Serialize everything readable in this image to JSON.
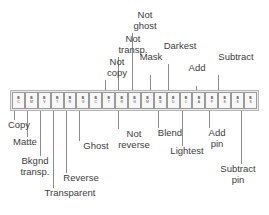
{
  "figure": {
    "kind": "labelled-toolbar-diagram",
    "colors": {
      "toolbar_fill": "#ececec",
      "toolbar_border": "#b4b4b4",
      "button_fill": "#f7f7f7",
      "button_border": "#9a9a9a",
      "leader_line": "#8c8c8c",
      "label_text": "#3d3d3d",
      "page_background": "#ffffff"
    }
  },
  "toolbar": {
    "name": "transfer-mode-toolbar",
    "button_count": 19,
    "buttons": [
      {
        "index": 0,
        "glyph_top": "B",
        "glyph_bottom": "C",
        "mode": "Copy"
      },
      {
        "index": 1,
        "glyph_top": "B",
        "glyph_bottom": "M",
        "mode": "Matte"
      },
      {
        "index": 2,
        "glyph_top": "B",
        "glyph_bottom": "V",
        "mode": "Bkgnd transp."
      },
      {
        "index": 3,
        "glyph_top": "B",
        "glyph_bottom": "T",
        "mode": "Transparent"
      },
      {
        "index": 4,
        "glyph_top": "B",
        "glyph_bottom": "R",
        "mode": "Reverse"
      },
      {
        "index": 5,
        "glyph_top": "B",
        "glyph_bottom": "G",
        "mode": "Ghost"
      },
      {
        "index": 6,
        "glyph_top": "B",
        "glyph_bottom": "C",
        "mode": "Not copy"
      },
      {
        "index": 7,
        "glyph_top": "B",
        "glyph_bottom": "T",
        "mode": "Not transp."
      },
      {
        "index": 8,
        "glyph_top": "B",
        "glyph_bottom": "R",
        "mode": "Not reverse"
      },
      {
        "index": 9,
        "glyph_top": "B",
        "glyph_bottom": "G",
        "mode": "Not ghost"
      },
      {
        "index": 10,
        "glyph_top": "B",
        "glyph_bottom": "M",
        "mode": "Mask"
      },
      {
        "index": 11,
        "glyph_top": "B",
        "glyph_bottom": "B",
        "mode": "Blend"
      },
      {
        "index": 12,
        "glyph_top": "B",
        "glyph_bottom": "D",
        "mode": "Darkest"
      },
      {
        "index": 13,
        "glyph_top": "B",
        "glyph_bottom": "L",
        "mode": "Lightest"
      },
      {
        "index": 14,
        "glyph_top": "B",
        "glyph_bottom": "A",
        "mode": "Add"
      },
      {
        "index": 15,
        "glyph_top": "B",
        "glyph_bottom": "P",
        "mode": "Add pin"
      },
      {
        "index": 16,
        "glyph_top": "B",
        "glyph_bottom": "S",
        "mode": "Subtract"
      },
      {
        "index": 17,
        "glyph_top": "B",
        "glyph_bottom": "S",
        "mode": "Subtract pin"
      },
      {
        "index": 18,
        "glyph_top": "B",
        "glyph_bottom": "S",
        "mode": "Subtract pin"
      }
    ]
  },
  "labels_above": [
    {
      "id": "not-copy",
      "text": "Not\ncopy",
      "left": 100,
      "top": 56,
      "width": 34,
      "target_x": 105
    },
    {
      "id": "not-transp",
      "text": "Not\ntransp.",
      "left": 113,
      "top": 33,
      "width": 40,
      "target_x": 118
    },
    {
      "id": "not-ghost",
      "text": "Not\nghost",
      "left": 127,
      "top": 9,
      "width": 36,
      "target_x": 132
    },
    {
      "id": "mask",
      "text": "Mask",
      "left": 146,
      "top": 51,
      "width": 30,
      "target_x": 150
    },
    {
      "id": "darkest",
      "text": "Darkest",
      "left": 163,
      "top": 40,
      "width": 44,
      "target_x": 168
    },
    {
      "id": "add",
      "text": "Add",
      "left": 192,
      "top": 62,
      "width": 26,
      "target_x": 196
    },
    {
      "id": "subtract",
      "text": "Subtract",
      "left": 213,
      "top": 51,
      "width": 50,
      "target_x": 218
    }
  ],
  "labels_below": [
    {
      "id": "copy",
      "text": "Copy",
      "left": 9,
      "top": 119,
      "width": 32,
      "target_x": 14
    },
    {
      "id": "matte",
      "text": "Matte",
      "left": 16,
      "top": 136,
      "width": 34,
      "target_x": 27
    },
    {
      "id": "bkgnd-transp",
      "text": "Bkgnd\ntransp.",
      "left": 26,
      "top": 155,
      "width": 42,
      "target_x": 40
    },
    {
      "id": "transparent",
      "text": "Transparent",
      "left": 41,
      "top": 187,
      "width": 66,
      "target_x": 53
    },
    {
      "id": "reverse",
      "text": "Reverse",
      "left": 62,
      "top": 172,
      "width": 46,
      "target_x": 66
    },
    {
      "id": "ghost",
      "text": "Ghost",
      "left": 78,
      "top": 140,
      "width": 36,
      "target_x": 79
    },
    {
      "id": "not-reverse",
      "text": "Not\nreverse",
      "left": 114,
      "top": 128,
      "width": 42,
      "target_x": 118
    },
    {
      "id": "blend",
      "text": "Blend",
      "left": 155,
      "top": 127,
      "width": 36,
      "target_x": 158
    },
    {
      "id": "lightest",
      "text": "Lightest",
      "left": 169,
      "top": 145,
      "width": 44,
      "target_x": 182
    },
    {
      "id": "add-pin",
      "text": "Add\npin",
      "left": 207,
      "top": 127,
      "width": 28,
      "target_x": 209
    },
    {
      "id": "subtract-pin",
      "text": "Subtract\npin",
      "left": 213,
      "top": 163,
      "width": 50,
      "target_x": 241
    }
  ]
}
